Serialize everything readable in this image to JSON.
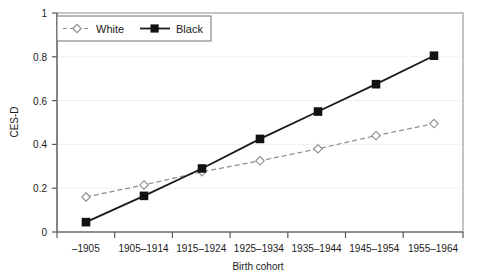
{
  "chart_data": {
    "type": "line",
    "title": "",
    "xlabel": "Birth cohort",
    "ylabel": "CES-D",
    "categories": [
      "–1905",
      "1905–1914",
      "1915–1924",
      "1925–1934",
      "1935–1944",
      "1945–1954",
      "1955–1964"
    ],
    "series": [
      {
        "name": "White",
        "values": [
          0.16,
          0.215,
          0.275,
          0.325,
          0.38,
          0.44,
          0.495
        ],
        "color": "#8c8c8c",
        "line_style": "dashed",
        "marker": "open-diamond"
      },
      {
        "name": "Black",
        "values": [
          0.045,
          0.165,
          0.29,
          0.425,
          0.55,
          0.675,
          0.805
        ],
        "color": "#1a1a1a",
        "line_style": "solid",
        "marker": "filled-square"
      }
    ],
    "ylim": [
      0,
      1
    ],
    "yticks": [
      0,
      0.2,
      0.4,
      0.6,
      0.8,
      1
    ],
    "ytick_labels": [
      "0",
      "0.2",
      "0.4",
      "0.6",
      "0.8",
      "1"
    ],
    "grid": "horizontal-dotted",
    "legend_position": "top-left-inside",
    "legend_entries": [
      "White",
      "Black"
    ]
  },
  "axes": {
    "y_title": "CES-D",
    "x_title": "Birth cohort"
  },
  "colors": {
    "white_series": "#8c8c8c",
    "black_series": "#1a1a1a",
    "grid": "#e2e2e2",
    "frame": "#8a8a8a",
    "background": "#ffffff"
  }
}
